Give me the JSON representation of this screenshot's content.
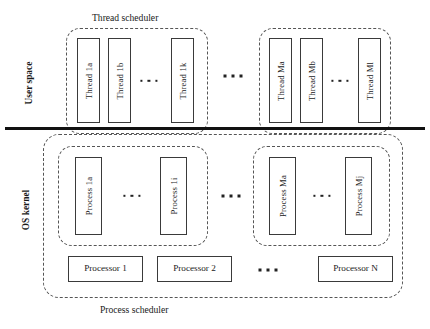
{
  "diagram": {
    "colors": {
      "stroke": "#3a3a3a",
      "dashed": "#555555",
      "divider": "#111111",
      "background": "#ffffff",
      "text": "#1a1a1a"
    },
    "captions": {
      "thread_scheduler": "Thread scheduler",
      "process_scheduler": "Process scheduler"
    },
    "side_labels": {
      "user_space": "User space",
      "os_kernel": "OS kernel"
    },
    "thread_groups": [
      {
        "id": "thread-group-1",
        "threads": [
          {
            "label": "Thread 1a"
          },
          {
            "label": "Thread 1b"
          },
          {
            "label": "Thread 1k"
          }
        ],
        "ellipsis": "..."
      },
      {
        "id": "thread-group-m",
        "threads": [
          {
            "label": "Thread Ma"
          },
          {
            "label": "Thread Mb"
          },
          {
            "label": "Thread Ml"
          }
        ],
        "ellipsis": "..."
      }
    ],
    "thread_groups_ellipsis": "...",
    "process_groups": [
      {
        "id": "process-group-1",
        "processes": [
          {
            "label": "Process 1a"
          },
          {
            "label": "Process 1i"
          }
        ],
        "ellipsis": "..."
      },
      {
        "id": "process-group-m",
        "processes": [
          {
            "label": "Process Ma"
          },
          {
            "label": "Process Mj"
          }
        ],
        "ellipsis": "..."
      }
    ],
    "process_groups_ellipsis": "...",
    "processors": [
      {
        "label": "Processor 1"
      },
      {
        "label": "Processor 2"
      },
      {
        "label": "Processor N"
      }
    ],
    "processors_ellipsis": "..."
  }
}
